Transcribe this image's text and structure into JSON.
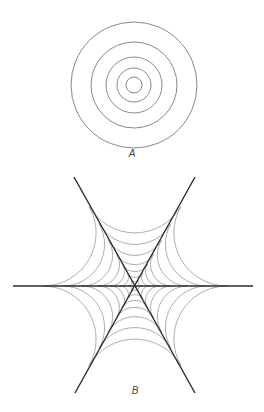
{
  "figure_a": {
    "label": "A",
    "label_pos": [
      132,
      153
    ],
    "center": [
      134,
      85
    ],
    "radii": [
      63,
      43,
      28,
      17,
      8
    ],
    "stroke": "#8a8a8a",
    "stroke_width": 1
  },
  "figure_b": {
    "label": "B",
    "label_pos": [
      135,
      390
    ],
    "center": [
      135,
      286
    ],
    "lines": [
      {
        "name": "horizontal-line",
        "from": [
          13,
          286
        ],
        "to": [
          253,
          286
        ]
      },
      {
        "name": "diagonal-line-descending",
        "from": [
          74,
          177
        ],
        "to": [
          195,
          393
        ]
      },
      {
        "name": "diagonal-line-ascending",
        "from": [
          195,
          177
        ],
        "to": [
          75,
          393
        ]
      }
    ],
    "line_stroke": "#2a2a2a",
    "line_width": 1.4,
    "wedge_bisectors_deg": [
      30,
      90,
      150,
      210,
      270,
      330
    ],
    "arc_tangent_distances": [
      92,
      72,
      53,
      37,
      25,
      15,
      7
    ],
    "arc_stroke": "#9a9a9a",
    "arc_width": 0.8
  }
}
